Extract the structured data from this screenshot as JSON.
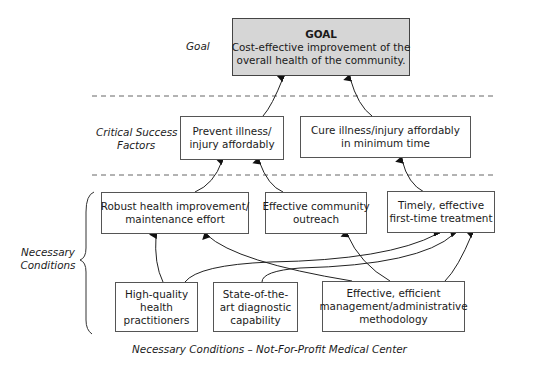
{
  "diagram": {
    "type": "necessary-conditions-tree",
    "caption": "Necessary Conditions – Not-For-Profit Medical Center",
    "levels": {
      "goal": "Goal",
      "csf": [
        "Critical Success",
        "Factors"
      ],
      "nc": [
        "Necessary",
        "Conditions"
      ]
    },
    "goal": {
      "title": "GOAL",
      "lines": [
        "Cost-effective improvement of the",
        "overall health of the community."
      ]
    },
    "critical_success_factors": [
      {
        "id": "csf1",
        "lines": [
          "Prevent illness/",
          "injury affordably"
        ]
      },
      {
        "id": "csf2",
        "lines": [
          "Cure illness/injury affordably",
          "in minimum time"
        ]
      }
    ],
    "necessary_conditions_upper": [
      {
        "id": "nc1",
        "lines": [
          "Robust health improvement/",
          "maintenance effort"
        ]
      },
      {
        "id": "nc2",
        "lines": [
          "Effective community",
          "outreach"
        ]
      },
      {
        "id": "nc3",
        "lines": [
          "Timely, effective",
          "first-time treatment"
        ]
      }
    ],
    "necessary_conditions_lower": [
      {
        "id": "nc4",
        "lines": [
          "High-quality",
          "health",
          "practitioners"
        ]
      },
      {
        "id": "nc5",
        "lines": [
          "State-of-the-",
          "art diagnostic",
          "capability"
        ]
      },
      {
        "id": "nc6",
        "lines": [
          "Effective, efficient",
          "management/administrative",
          "methodology"
        ]
      }
    ],
    "connections": [
      {
        "from": "csf1",
        "to": "goal"
      },
      {
        "from": "csf2",
        "to": "goal"
      },
      {
        "from": "nc1",
        "to": "csf1"
      },
      {
        "from": "nc2",
        "to": "csf1"
      },
      {
        "from": "nc3",
        "to": "csf2"
      },
      {
        "from": "nc4",
        "to": "nc1"
      },
      {
        "from": "nc4",
        "to": "nc3"
      },
      {
        "from": "nc5",
        "to": "nc3"
      },
      {
        "from": "nc6",
        "to": "nc1"
      },
      {
        "from": "nc6",
        "to": "nc2"
      },
      {
        "from": "nc6",
        "to": "nc3"
      }
    ],
    "colors": {
      "goal_fill": "#d6d6d6",
      "stroke": "#333333",
      "dash": "#555555"
    }
  }
}
